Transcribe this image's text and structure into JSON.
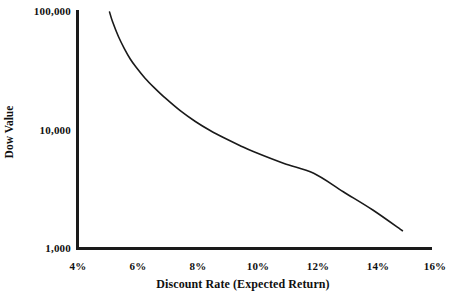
{
  "chart_data": {
    "type": "line",
    "title": "",
    "xlabel": "Discount Rate (Expected Return)",
    "ylabel": "Dow Value",
    "xlim": [
      4,
      16
    ],
    "ylim": [
      1000,
      100000
    ],
    "yscale": "log",
    "xscale": "linear",
    "grid": false,
    "legend": null,
    "xticks": [
      "4%",
      "6%",
      "8%",
      "10%",
      "12%",
      "14%",
      "16%"
    ],
    "xtick_values": [
      4,
      6,
      8,
      10,
      12,
      14,
      16
    ],
    "yticks": [
      "1,000",
      "10,000",
      "100,000"
    ],
    "ytick_values": [
      1000,
      10000,
      100000
    ],
    "series": [
      {
        "name": "Dow Value vs Discount Rate",
        "x": [
          5.1,
          5.2,
          5.4,
          5.6,
          5.8,
          6.0,
          6.3,
          6.6,
          7.0,
          7.5,
          8.0,
          8.5,
          9.0,
          9.5,
          10.0,
          11.0,
          12.0,
          13.0,
          14.0,
          15.0
        ],
        "y": [
          100000,
          83000,
          62000,
          49000,
          40000,
          34000,
          27500,
          23000,
          18500,
          14500,
          11800,
          9900,
          8500,
          7400,
          6500,
          5200,
          4300,
          3000,
          2100,
          1400
        ]
      }
    ]
  },
  "axis": {
    "y_title": "Dow Value",
    "x_title": "Discount Rate (Expected Return)",
    "y_tick_labels": [
      "100,000",
      "10,000",
      "1,000"
    ],
    "x_tick_labels": [
      "4%",
      "6%",
      "8%",
      "10%",
      "12%",
      "14%",
      "16%"
    ]
  },
  "colors": {
    "axis": "#1a1a1a",
    "curve": "#1a1a1a",
    "text": "#101010",
    "background": "#ffffff"
  }
}
